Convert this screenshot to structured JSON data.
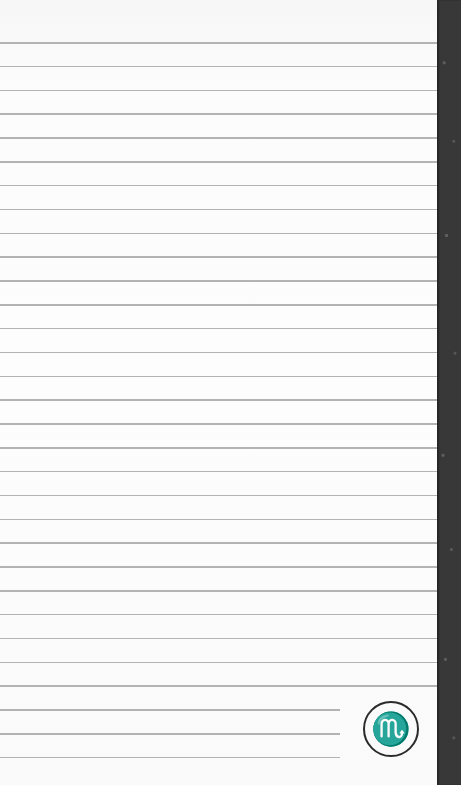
{
  "page": {
    "type": "lined-notepad-page",
    "background_color": "#fbfbfb",
    "line_color": "#b3b3b3",
    "edge_color": "#383838"
  },
  "lines": {
    "count": 31,
    "first_y": 42,
    "spacing": 23.83,
    "full_width": 437,
    "short_width": 340,
    "short_line_count": 3
  },
  "zodiac_badge": {
    "symbol": "♏",
    "sign": "Scorpio"
  }
}
